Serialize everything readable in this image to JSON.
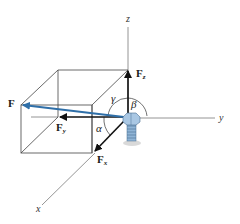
{
  "diagram": {
    "type": "3d-force-vector-components",
    "colors": {
      "resultant": "#2f6fa8",
      "components": "#111111",
      "box": "#444444",
      "axes": "#777777",
      "bolt": "#8fb4d6"
    },
    "axes": {
      "x": "x",
      "y": "y",
      "z": "z"
    },
    "vectors": {
      "resultant": "F",
      "fx_main": "F",
      "fx_sub": "x",
      "fy_main": "F",
      "fy_sub": "y",
      "fz_main": "F",
      "fz_sub": "z"
    },
    "angles": {
      "alpha": "α",
      "beta": "β",
      "gamma": "γ"
    }
  }
}
